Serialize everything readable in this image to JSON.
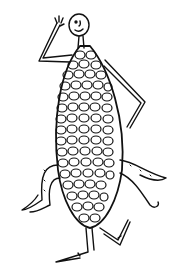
{
  "illustration": {
    "subject": "dancing corn cob character",
    "style": "black ink line drawing on white",
    "colors": {
      "ink": "#111111",
      "background": "#ffffff"
    }
  }
}
